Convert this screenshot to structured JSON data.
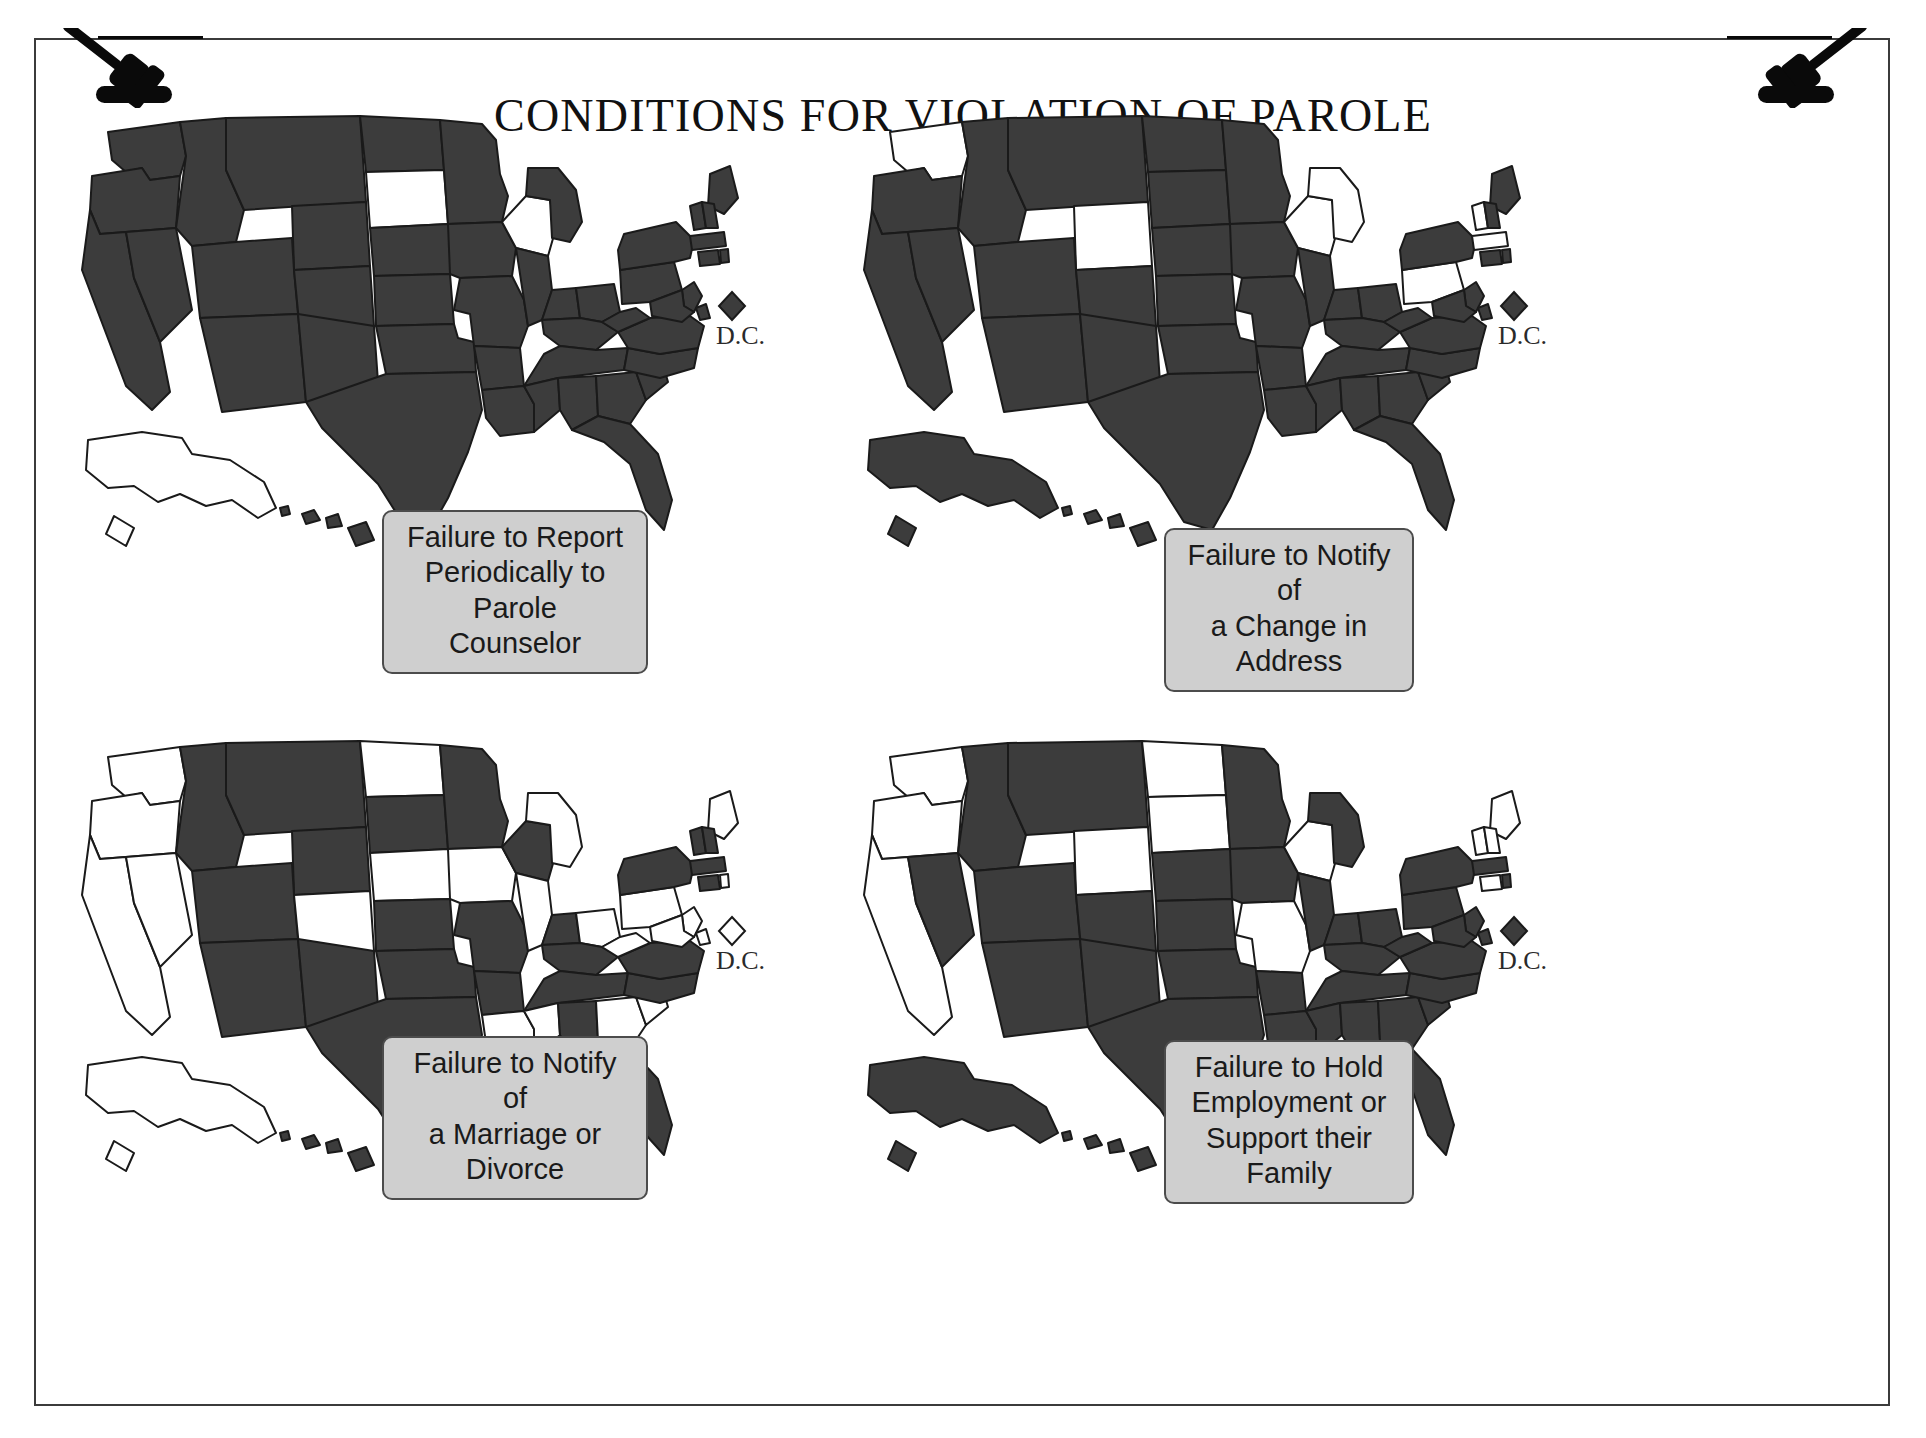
{
  "document": {
    "title": "CONDITIONS FOR VIOLATION OF PAROLE",
    "icons": {
      "left": "gavel-icon",
      "right": "gavel-icon"
    }
  },
  "legend": {
    "shaded_color": "#3c3c3c",
    "unshaded_color": "#ffffff",
    "outline_color": "#1a1a1a",
    "caption_fill": "#cfcfcf",
    "caption_border": "#4c4c4c",
    "shaded_meaning": "Condition applies",
    "unshaded_meaning": "Condition does not apply"
  },
  "dc_marker": {
    "label": "D.C.",
    "shape": "diamond"
  },
  "panels": [
    {
      "id": "panel-1",
      "caption": "Failure to Report\nPeriodically to Parole\nCounselor",
      "dc_filled": true,
      "unshaded_states": [
        "SD",
        "WI",
        "AK"
      ],
      "shaded_count": 48
    },
    {
      "id": "panel-2",
      "caption": "Failure to Notify of\na Change in Address",
      "dc_filled": true,
      "unshaded_states": [
        "WA",
        "WY",
        "WI",
        "MI",
        "MA",
        "PA",
        "VT"
      ],
      "shaded_count": 44
    },
    {
      "id": "panel-3",
      "caption": "Failure to Notify of\na Marriage or Divorce",
      "dc_filled": false,
      "unshaded_states": [
        "WA",
        "OR",
        "CA",
        "NV",
        "ND",
        "CO",
        "IA",
        "IL",
        "MI",
        "OH",
        "ME",
        "PA",
        "MD",
        "DE",
        "SC",
        "GA",
        "MS",
        "LA",
        "AK",
        "NE",
        "WV",
        "RI",
        "NJ"
      ],
      "shaded_count": 28
    },
    {
      "id": "panel-4",
      "caption": "Failure to Hold\nEmployment or\nSupport their Family",
      "dc_filled": true,
      "unshaded_states": [
        "WA",
        "OR",
        "CA",
        "WY",
        "ND",
        "SD",
        "MO",
        "WI",
        "ME",
        "NH",
        "VT",
        "CT"
      ],
      "shaded_count": 39
    }
  ],
  "chart_data": {
    "type": "map",
    "title": "CONDITIONS FOR VIOLATION OF PAROLE",
    "subtype": "choropleth-small-multiples",
    "panel_count": 4,
    "encoding": {
      "filled": "state imposes this parole condition",
      "empty": "state does not impose this parole condition"
    },
    "series": [
      {
        "name": "Failure to Report Periodically to Parole Counselor",
        "unshaded": [
          "SD",
          "WI",
          "AK"
        ]
      },
      {
        "name": "Failure to Notify of a Change in Address",
        "unshaded": [
          "WA",
          "WY",
          "WI",
          "MI",
          "MA",
          "PA",
          "VT"
        ]
      },
      {
        "name": "Failure to Notify of a Marriage or Divorce",
        "unshaded": [
          "WA",
          "OR",
          "CA",
          "NV",
          "ND",
          "CO",
          "IA",
          "IL",
          "MI",
          "OH",
          "ME",
          "PA",
          "MD",
          "DE",
          "SC",
          "GA",
          "MS",
          "LA",
          "AK",
          "NE",
          "WV",
          "RI",
          "NJ"
        ]
      },
      {
        "name": "Failure to Hold Employment or Support their Family",
        "unshaded": [
          "WA",
          "OR",
          "CA",
          "WY",
          "ND",
          "SD",
          "MO",
          "WI",
          "ME",
          "NH",
          "VT",
          "CT"
        ]
      }
    ]
  }
}
